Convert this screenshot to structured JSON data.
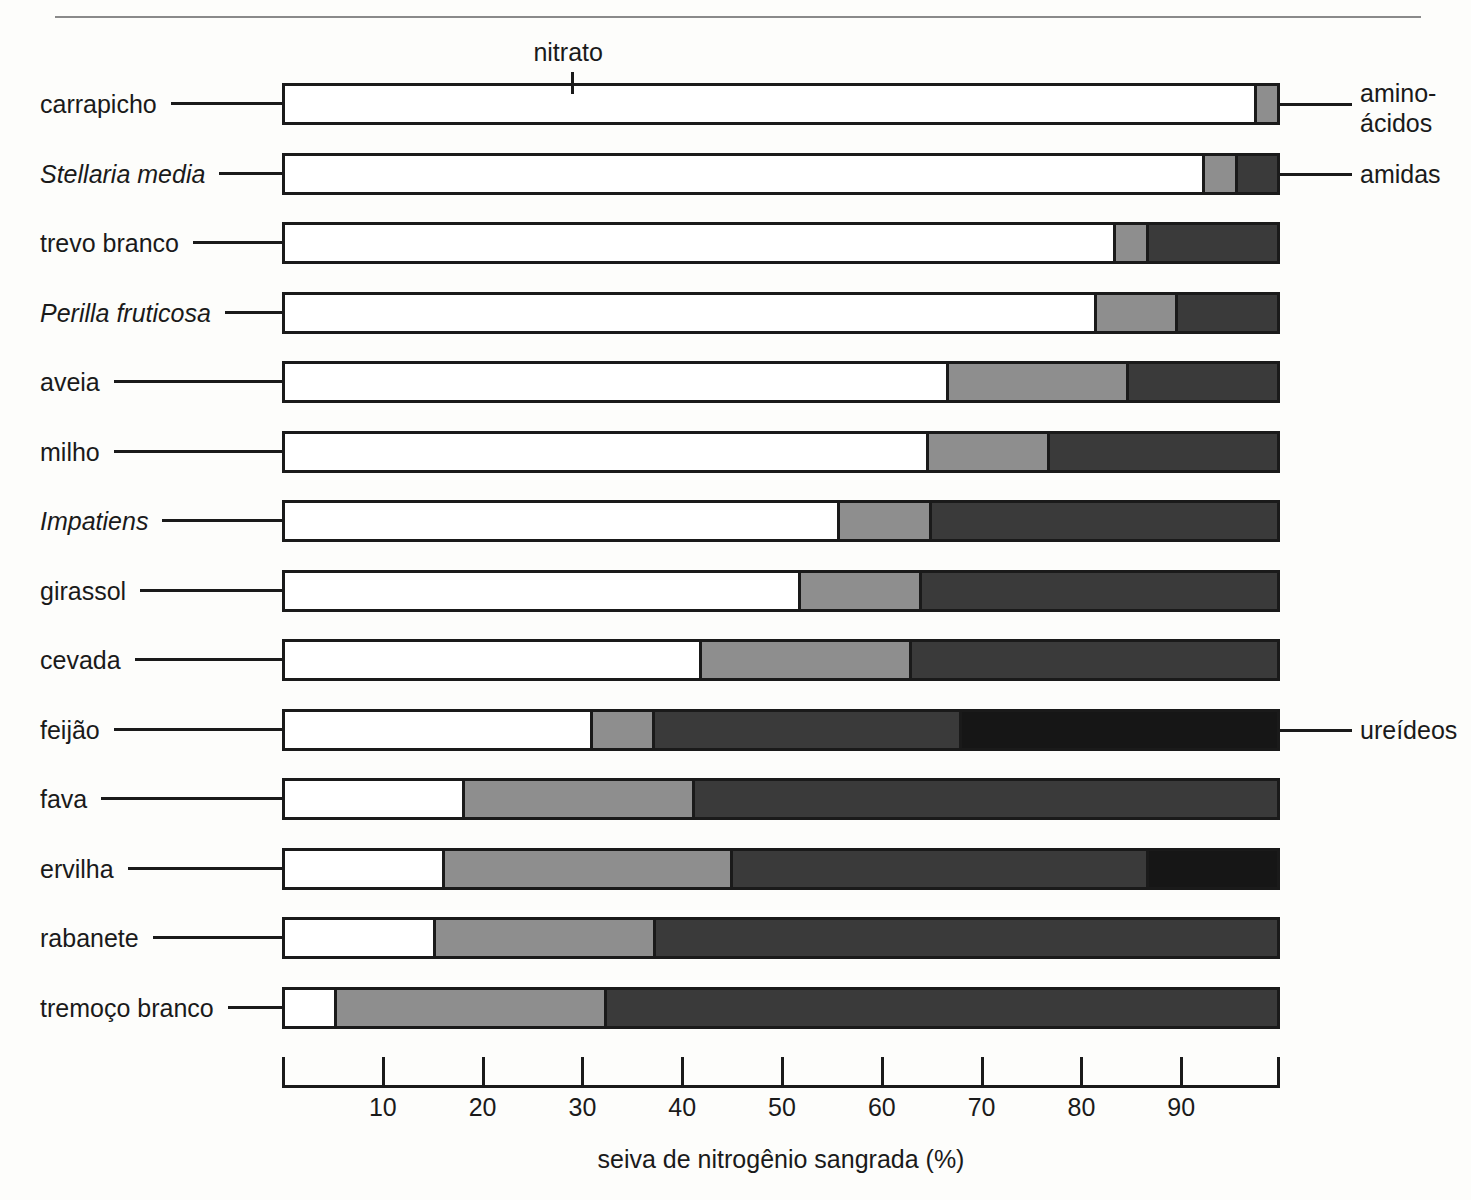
{
  "chart_data": {
    "type": "bar",
    "orientation": "horizontal",
    "stacked": true,
    "title": "",
    "xlabel": "seiva de nitrogênio sangrada (%)",
    "ylabel": "",
    "xlim": [
      0,
      100
    ],
    "xticks": [
      10,
      20,
      30,
      40,
      50,
      60,
      70,
      80,
      90
    ],
    "xtick_labels": [
      "10",
      "20",
      "30",
      "40",
      "50",
      "60",
      "70",
      "80",
      "90"
    ],
    "grid": false,
    "legend_position": "callouts",
    "series": [
      {
        "name": "nitrato",
        "color": "#ffffff",
        "values": [
          98,
          93,
          84,
          82,
          67,
          65,
          56,
          52,
          42,
          31,
          18,
          16,
          15,
          5
        ]
      },
      {
        "name": "amino-ácidos",
        "color": "#8e8e8e",
        "values": [
          2,
          3,
          3,
          8,
          18,
          12,
          9,
          12,
          21,
          6,
          23,
          29,
          22,
          27
        ]
      },
      {
        "name": "amidas",
        "color": "#3a3a3a",
        "values": [
          0,
          4,
          13,
          10,
          15,
          23,
          35,
          36,
          37,
          31,
          59,
          42,
          63,
          68
        ]
      },
      {
        "name": "ureídeos",
        "color": "#161616",
        "values": [
          0,
          0,
          0,
          0,
          0,
          0,
          0,
          0,
          0,
          32,
          0,
          13,
          0,
          0
        ]
      }
    ],
    "categories": [
      {
        "label": "carrapicho",
        "italic": false
      },
      {
        "label": "Stellaria media",
        "italic": true
      },
      {
        "label": "trevo branco",
        "italic": false
      },
      {
        "label": "Perilla fruticosa",
        "italic": true
      },
      {
        "label": "aveia",
        "italic": false
      },
      {
        "label": "milho",
        "italic": false
      },
      {
        "label": "Impatiens",
        "italic": true
      },
      {
        "label": "girassol",
        "italic": false
      },
      {
        "label": "cevada",
        "italic": false
      },
      {
        "label": "feijão",
        "italic": false
      },
      {
        "label": "fava",
        "italic": false
      },
      {
        "label": "ervilha",
        "italic": false
      },
      {
        "label": "rabanete",
        "italic": false
      },
      {
        "label": "tremoço branco",
        "italic": false
      }
    ],
    "annotations": [
      {
        "name": "nitrato",
        "text": "nitrato",
        "position": "top",
        "target_row": 0,
        "target_value": 29
      },
      {
        "name": "amino-acidos",
        "text": "amino-\nácidos",
        "position": "right",
        "target_row": 0,
        "target_value": 99
      },
      {
        "name": "amidas",
        "text": "amidas",
        "position": "right",
        "target_row": 1,
        "target_value": 98
      },
      {
        "name": "ureideos",
        "text": "ureídeos",
        "position": "right",
        "target_row": 9,
        "target_value": 99
      }
    ]
  },
  "annotation_labels": {
    "nitrato": "nitrato",
    "amino_line1": "amino-",
    "amino_line2": "ácidos",
    "amidas": "amidas",
    "ureideos": "ureídeos"
  },
  "axis": {
    "title": "seiva de nitrogênio sangrada (%)"
  }
}
